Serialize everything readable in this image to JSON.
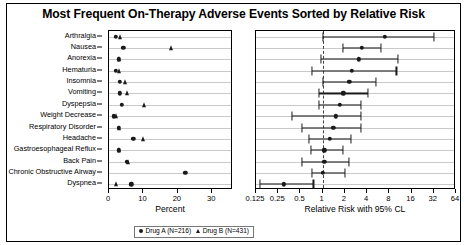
{
  "title": "Most Frequent On-Therapy Adverse Events Sorted by Relative Risk",
  "legend": {
    "drug_a": "Drug A (N=216)",
    "drug_b": "Drug B (N=431)",
    "drug_a_marker": "circle-marker",
    "drug_b_marker": "triangle-marker"
  },
  "left_panel": {
    "xlabel": "Percent",
    "ticks": [
      "0",
      "10",
      "20",
      "30"
    ]
  },
  "right_panel": {
    "xlabel": "Relative Risk with 95% CL",
    "ticks": [
      "0.125",
      "0.25",
      "0.5",
      "1",
      "2",
      "4",
      "8",
      "16",
      "32",
      "64"
    ],
    "reference_value": 1
  },
  "chart_data": {
    "type": "scatter",
    "title": "Most Frequent On-Therapy Adverse Events Sorted by Relative Risk",
    "categories": [
      "Arthralgia",
      "Nausea",
      "Anorexia",
      "Hematuria",
      "Insomnia",
      "Vomiting",
      "Dyspepsia",
      "Weight Decrease",
      "Respiratory Disorder",
      "Headache",
      "Gastroesophageal Reflux",
      "Back Pain",
      "Chronic Obstructive Airway",
      "Dyspnea"
    ],
    "panels": [
      {
        "name": "percent",
        "xlabel": "Percent",
        "xlim": [
          0,
          36
        ],
        "scale": "linear",
        "ticks": [
          0,
          10,
          20,
          30
        ],
        "series": [
          {
            "name": "Drug A (N=216)",
            "marker": "circle",
            "values": [
              1.9,
              4.2,
              2.8,
              1.9,
              3.2,
              3.2,
              3.7,
              1.4,
              2.8,
              7.0,
              2.8,
              5.1,
              22.2,
              6.5
            ]
          },
          {
            "name": "Drug B (N=431)",
            "marker": "triangle",
            "values": [
              3.3,
              18.1,
              3.0,
              3.0,
              4.6,
              5.3,
              10.2,
              2.1,
              3.0,
              10.0,
              3.0,
              5.6,
              null,
              1.9
            ]
          }
        ]
      },
      {
        "name": "relative_risk",
        "xlabel": "Relative Risk with 95% CL",
        "scale": "log2",
        "xlim": [
          0.125,
          64
        ],
        "ticks": [
          0.125,
          0.25,
          0.5,
          1,
          2,
          4,
          8,
          16,
          32,
          64
        ],
        "reference_value": 1,
        "points": [
          {
            "category": "Arthralgia",
            "rr": 7.0,
            "lower": 1.0,
            "upper": 32.0
          },
          {
            "category": "Nausea",
            "rr": 3.4,
            "lower": 1.9,
            "upper": 6.1
          },
          {
            "category": "Anorexia",
            "rr": 3.1,
            "lower": 0.95,
            "upper": 10.5
          },
          {
            "category": "Hematuria",
            "rr": 2.5,
            "lower": 0.72,
            "upper": 10.0
          },
          {
            "category": "Insomnia",
            "rr": 2.3,
            "lower": 1.0,
            "upper": 5.2
          },
          {
            "category": "Vomiting",
            "rr": 1.9,
            "lower": 0.88,
            "upper": 4.1
          },
          {
            "category": "Dyspepsia",
            "rr": 1.7,
            "lower": 0.88,
            "upper": 3.3
          },
          {
            "category": "Weight Decrease",
            "rr": 1.5,
            "lower": 0.38,
            "upper": 3.3
          },
          {
            "category": "Respiratory Disorder",
            "rr": 1.4,
            "lower": 0.52,
            "upper": 3.3
          },
          {
            "category": "Headache",
            "rr": 1.25,
            "lower": 0.65,
            "upper": 2.4
          },
          {
            "category": "Gastroesophageal Reflux",
            "rr": 1.05,
            "lower": 0.7,
            "upper": 1.9
          },
          {
            "category": "Back Pain",
            "rr": 1.05,
            "lower": 0.52,
            "upper": 2.3
          },
          {
            "category": "Chronic Obstructive Airway",
            "rr": 1.0,
            "lower": 0.72,
            "upper": 2.0
          },
          {
            "category": "Dyspnea",
            "rr": 0.3,
            "lower": 0.14,
            "upper": 0.75
          }
        ]
      }
    ]
  }
}
